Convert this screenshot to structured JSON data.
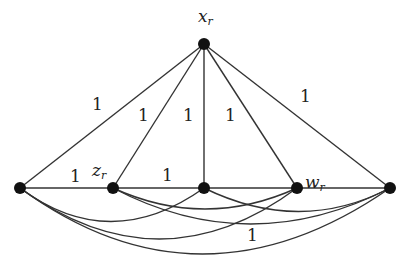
{
  "diagram": {
    "type": "graph",
    "nodes": [
      {
        "id": "x_r",
        "label": "x",
        "subscript": "r",
        "x": 204,
        "y": 44
      },
      {
        "id": "a",
        "label": "",
        "x": 20,
        "y": 188
      },
      {
        "id": "z_r",
        "label": "z",
        "subscript": "r",
        "x": 113,
        "y": 188
      },
      {
        "id": "m",
        "label": "",
        "x": 204,
        "y": 188
      },
      {
        "id": "w_r",
        "label": "w",
        "subscript": "r",
        "x": 297,
        "y": 188
      },
      {
        "id": "e",
        "label": "",
        "x": 390,
        "y": 188
      }
    ],
    "edge_labels": {
      "x_a": "1",
      "x_z": "1",
      "x_m": "1",
      "x_w": "1",
      "x_e": "1",
      "a_z": "1",
      "z_m": "1",
      "a_e_curve": "1"
    },
    "node_color": "#111111",
    "edge_color": "#333333"
  }
}
